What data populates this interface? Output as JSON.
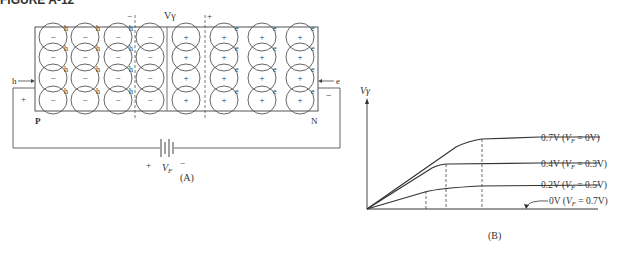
{
  "figure": {
    "title": "FIGURE A-12",
    "panel_a_label": "(A)",
    "panel_b_label": "(B)"
  },
  "panel_a": {
    "depletion_label": "Vγ",
    "depletion_minus": "−",
    "depletion_plus": "+",
    "p_label": "P",
    "n_label": "N",
    "hole_label": "h",
    "electron_label": "e",
    "hole_arrow_label": "h",
    "electron_arrow_label": "e",
    "left_terminal_sign": "+",
    "right_terminal_sign": "−",
    "p_ion_sign": "−",
    "n_ion_sign": "+",
    "battery_plus": "+",
    "battery_minus": "−",
    "battery_label": "V",
    "battery_subscript": "F",
    "rows": 4,
    "p_columns": 4,
    "n_columns": 4
  },
  "chart_data": {
    "type": "line",
    "title": "",
    "ylabel": "Vγ",
    "xlabel": "",
    "series": [
      {
        "name": "0.7V (VF = 0V)",
        "barrier_V": 0.7,
        "forward_bias_V": 0.0
      },
      {
        "name": "0.4V (VF = 0.3V)",
        "barrier_V": 0.4,
        "forward_bias_V": 0.3
      },
      {
        "name": "0.2V (VF = 0.5V)",
        "barrier_V": 0.2,
        "forward_bias_V": 0.5
      },
      {
        "name": "0V (VF = 0.7V)",
        "barrier_V": 0.0,
        "forward_bias_V": 0.7
      }
    ],
    "labels": {
      "s0_main": "0.7V (",
      "s0_v": "V",
      "s0_sub": "F",
      "s0_rest": " = 0V)",
      "s1_main": "0.4V (",
      "s1_v": "V",
      "s1_sub": "F",
      "s1_rest": " = 0.3V)",
      "s2_main": "0.2V (",
      "s2_v": "V",
      "s2_sub": "F",
      "s2_rest": " = 0.5V)",
      "s3_main": "0V (",
      "s3_v": "V",
      "s3_sub": "F",
      "s3_rest": " = 0.7V)"
    },
    "grid": false,
    "legend": "inline-right"
  }
}
